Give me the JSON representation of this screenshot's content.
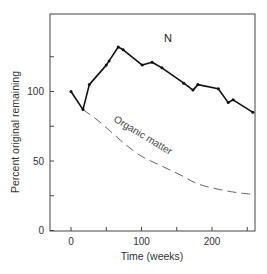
{
  "chart_data": {
    "type": "line",
    "title": "",
    "xlabel": "Time (weeks)",
    "ylabel": "Percent original remaining",
    "xlim": [
      -30,
      260
    ],
    "ylim": [
      0,
      150
    ],
    "x_ticks": [
      0,
      50,
      100,
      150,
      200,
      250
    ],
    "x_tick_labels": [
      "0",
      "",
      "100",
      "",
      "200",
      ""
    ],
    "y_ticks": [
      0,
      25,
      50,
      75,
      100,
      125
    ],
    "y_tick_labels": [
      "0",
      "",
      "50",
      "",
      "100",
      ""
    ],
    "grid": false,
    "legend": "none (inline labels)",
    "series": [
      {
        "name": "N",
        "style": "solid with markers",
        "color": "#111111",
        "x": [
          0,
          17,
          26,
          50,
          54,
          67,
          74,
          101,
          115,
          129,
          160,
          173,
          180,
          209,
          223,
          230,
          258
        ],
        "y": [
          100,
          87,
          105,
          119,
          122,
          132,
          130,
          119,
          121,
          117,
          106,
          101,
          105,
          102,
          92,
          94,
          85
        ]
      },
      {
        "name": "Organic matter",
        "style": "dashed",
        "color": "#555555",
        "x": [
          0,
          17,
          41,
          70,
          98,
          126,
          155,
          183,
          226,
          258
        ],
        "y": [
          100,
          87,
          78,
          65,
          54,
          47,
          40,
          33,
          28,
          26
        ]
      }
    ],
    "annotations": [
      {
        "text": "N",
        "x": 138,
        "y": 138
      },
      {
        "text": "Organic matter",
        "x": 110,
        "y": 75,
        "rotation": 30
      }
    ]
  },
  "labels": {
    "x_axis_title": "Time (weeks)",
    "y_axis_title": "Percent original remaining",
    "series_n": "N",
    "series_om": "Organic matter"
  }
}
